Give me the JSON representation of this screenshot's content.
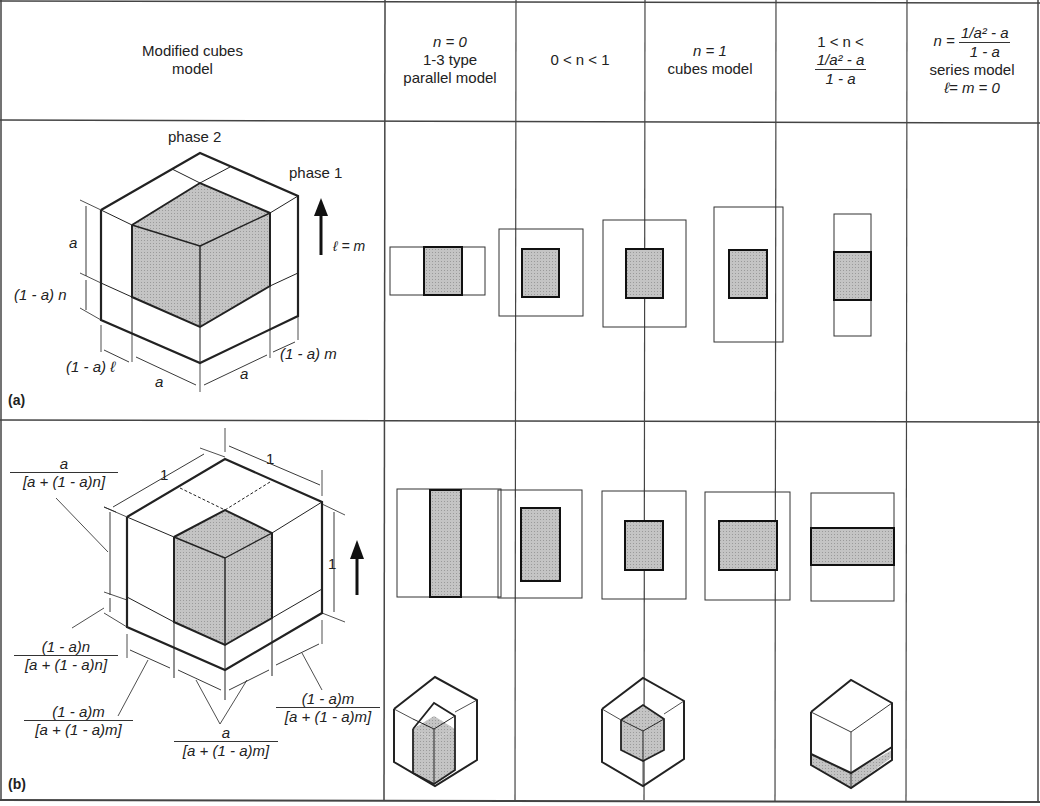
{
  "figure": {
    "header": {
      "col0": [
        "Modified cubes",
        "model"
      ],
      "col1": {
        "line1": "n = 0",
        "line2": "1-3 type",
        "line3": "parallel model"
      },
      "col2": {
        "line1": "0 < n < 1"
      },
      "col3": {
        "line1": "n = 1",
        "line2": "cubes model"
      },
      "col4": {
        "line1": "1 < n <",
        "num": "1/a² - a",
        "den": "1 - a"
      },
      "col5": {
        "prefix": "n =",
        "num": "1/a² - a",
        "den": "1 - a",
        "line2": "series model",
        "line3": "ℓ= m = 0"
      }
    },
    "row_a": {
      "label": "(a)",
      "phase2": "phase 2",
      "phase1": "phase 1",
      "arrow_label": "ℓ = m",
      "dim_a_vertical": "a",
      "dim_n": "(1 - a) n",
      "dim_l": "(1 - a) ℓ",
      "dim_a_left": "a",
      "dim_a_right": "a",
      "dim_m": "(1 - a) m"
    },
    "row_b": {
      "label": "(b)",
      "dim_top_left": "1",
      "dim_top_right": "1",
      "dim_right": "1",
      "frac_a_n": {
        "num": "a",
        "den": "[a + (1 - a)n]"
      },
      "frac_n": {
        "num": "(1 - a)n",
        "den": "[a + (1 - a)n]"
      },
      "frac_m_left": {
        "num": "(1 - a)m",
        "den": "[a + (1 - a)m]"
      },
      "frac_a_m": {
        "num": "a",
        "den": "[a + (1 - a)m]"
      },
      "frac_m_right": {
        "num": "(1 - a)m",
        "den": "[a + (1 - a)m]"
      }
    },
    "colors": {
      "line": "#333333",
      "shade": "#bdbdbd",
      "background": "#ffffff"
    }
  }
}
